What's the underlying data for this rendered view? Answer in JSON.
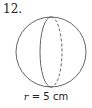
{
  "problem": {
    "number": "12.",
    "figure": "sphere",
    "caption_var": "r",
    "caption_rest": " = 5 cm"
  },
  "colors": {
    "stroke": "#555555",
    "text": "#222222"
  }
}
